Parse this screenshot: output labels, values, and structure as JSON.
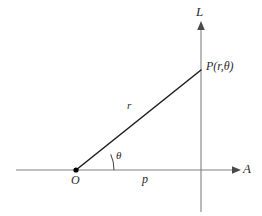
{
  "figure": {
    "background_color": "#ffffff",
    "axis_color": "#808080",
    "ray_color": "#1a1a1a",
    "label_color": "#2b2b2b",
    "width": 262,
    "height": 216
  },
  "labels": {
    "vertical_axis": "L",
    "horizontal_axis": "A",
    "point": "P(r,θ)",
    "origin": "O",
    "angle": "θ",
    "polar_axis_segment": "p",
    "radius": "r"
  },
  "geometry": {
    "origin": {
      "x": 76,
      "y": 170
    },
    "point_p": {
      "x": 201,
      "y": 70
    },
    "horizontal_axis": {
      "x1": 16,
      "y1": 170,
      "x2": 232,
      "y2": 170
    },
    "vertical_axis": {
      "x1": 201,
      "y1": 30,
      "x2": 201,
      "y2": 212
    },
    "angle_arc_radius": 38,
    "angle_degrees": 24
  }
}
